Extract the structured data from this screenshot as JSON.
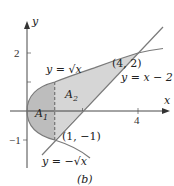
{
  "figure": {
    "caption": "(b)",
    "axes": {
      "x_label": "x",
      "y_label": "y",
      "x_ticks": [
        {
          "value": 4,
          "label": "4"
        }
      ],
      "y_ticks": [
        {
          "value": 2,
          "label": "2"
        },
        {
          "value": -1,
          "label": "−1"
        }
      ]
    },
    "curves": [
      {
        "name": "upper-root",
        "label": "y = √x"
      },
      {
        "name": "lower-root",
        "label": "y = −√x"
      },
      {
        "name": "line",
        "label": "y = x − 2"
      }
    ],
    "points": [
      {
        "label": "(4, 2)"
      },
      {
        "label": "(1, −1)"
      }
    ],
    "regions": [
      {
        "name": "A1",
        "label": "A",
        "sub": "1"
      },
      {
        "name": "A2",
        "label": "A",
        "sub": "2"
      }
    ],
    "colors": {
      "region_fill": "#d4d4d4",
      "region_a1_fill": "#bdbdbd",
      "curve_stroke": "#7a7a7a",
      "axis_stroke": "#333333"
    }
  }
}
